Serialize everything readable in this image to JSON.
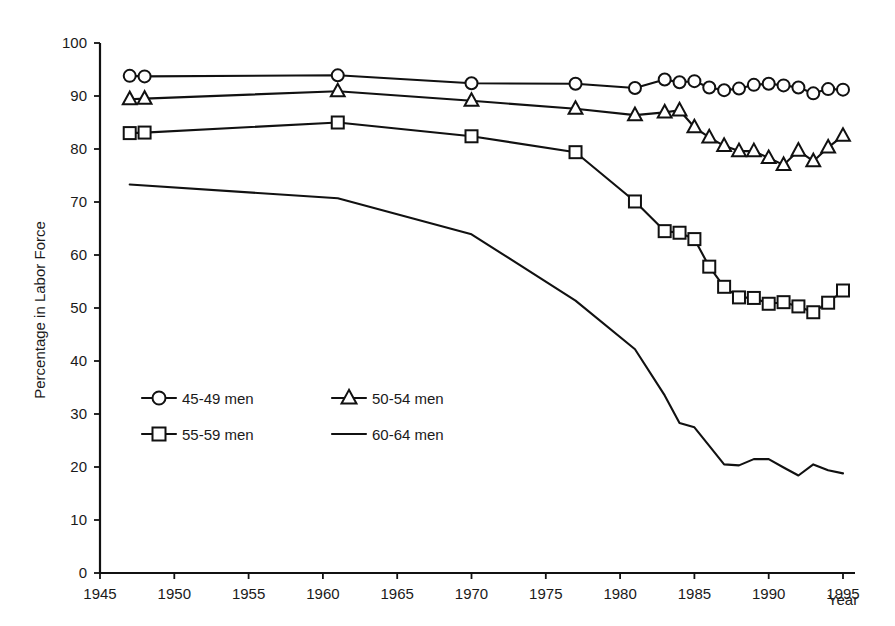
{
  "chart_data": {
    "type": "line",
    "title": "",
    "xlabel": "Year",
    "ylabel": "Percentage in Labor Force",
    "xlim": [
      1945,
      1995
    ],
    "ylim": [
      0,
      100
    ],
    "xticks": [
      1945,
      1950,
      1955,
      1960,
      1965,
      1970,
      1975,
      1980,
      1985,
      1990,
      1995
    ],
    "yticks": [
      0,
      10,
      20,
      30,
      40,
      50,
      60,
      70,
      80,
      90,
      100
    ],
    "grid": false,
    "legend_position": "inside-left-middle",
    "series": [
      {
        "name": "45-49 men",
        "marker": "circle",
        "x": [
          1947,
          1948,
          1961,
          1970,
          1977,
          1981,
          1983,
          1984,
          1985,
          1986,
          1987,
          1988,
          1989,
          1990,
          1991,
          1992,
          1993,
          1994,
          1995
        ],
        "values": [
          93.8,
          93.7,
          93.9,
          92.4,
          92.3,
          91.5,
          93.1,
          92.6,
          92.8,
          91.6,
          91.1,
          91.4,
          92.1,
          92.3,
          92.0,
          91.6,
          90.5,
          91.3,
          91.2
        ]
      },
      {
        "name": "50-54 men",
        "marker": "triangle",
        "x": [
          1947,
          1948,
          1961,
          1970,
          1977,
          1981,
          1983,
          1984,
          1985,
          1986,
          1987,
          1988,
          1989,
          1990,
          1991,
          1992,
          1993,
          1994,
          1995
        ],
        "values": [
          89.4,
          89.5,
          90.9,
          89.1,
          87.6,
          86.4,
          86.9,
          87.3,
          84.1,
          82.2,
          80.6,
          79.6,
          79.6,
          78.3,
          77.0,
          79.7,
          77.7,
          80.3,
          82.5
        ]
      },
      {
        "name": "55-59 men",
        "marker": "square",
        "x": [
          1947,
          1948,
          1961,
          1970,
          1977,
          1981,
          1983,
          1984,
          1985,
          1986,
          1987,
          1988,
          1989,
          1990,
          1991,
          1992,
          1993,
          1994,
          1995
        ],
        "values": [
          83.0,
          83.1,
          85.0,
          82.4,
          79.4,
          70.1,
          64.5,
          64.2,
          63.0,
          57.8,
          54.0,
          52.0,
          51.9,
          50.8,
          51.1,
          50.3,
          49.2,
          51.0,
          53.3
        ]
      },
      {
        "name": "60-64 men",
        "marker": "none",
        "x": [
          1947,
          1961,
          1970,
          1977,
          1981,
          1983,
          1984,
          1985,
          1986,
          1987,
          1988,
          1989,
          1990,
          1991,
          1992,
          1993,
          1994,
          1995
        ],
        "values": [
          73.3,
          70.7,
          63.9,
          51.4,
          42.2,
          33.5,
          28.3,
          27.5,
          24.0,
          20.5,
          20.3,
          21.5,
          21.5,
          19.9,
          18.4,
          20.5,
          19.4,
          18.8
        ]
      }
    ]
  },
  "legend": {
    "entries": [
      {
        "label": "45-49 men",
        "marker": "circle"
      },
      {
        "label": "50-54 men",
        "marker": "triangle"
      },
      {
        "label": "55-59 men",
        "marker": "square"
      },
      {
        "label": "60-64 men",
        "marker": "none"
      }
    ]
  },
  "axes": {
    "y_label": "Percentage in Labor Force",
    "x_label": "Year",
    "y_tick_labels": [
      "100",
      "90",
      "80",
      "70",
      "60",
      "50",
      "40",
      "30",
      "20",
      "10",
      "0"
    ],
    "x_tick_labels": [
      "1945",
      "1950",
      "1955",
      "1960",
      "1965",
      "1970",
      "1975",
      "1980",
      "1985",
      "1990",
      "1995"
    ]
  }
}
